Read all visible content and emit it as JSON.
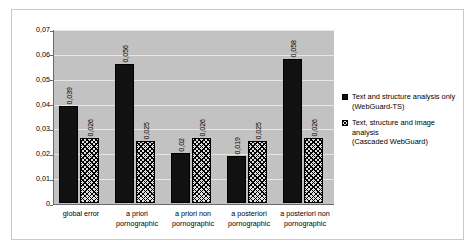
{
  "chart_data": {
    "type": "bar",
    "title": "",
    "xlabel": "",
    "ylabel": "",
    "ylim": [
      0,
      0.07
    ],
    "grid": true,
    "legend_position": "right",
    "decimal_separator": ",",
    "categories": [
      "global error",
      "a priori pornographic",
      "a priori non pornographic",
      "a posteriori pornographic",
      "a posteriori non pornographic"
    ],
    "category_lines": [
      [
        "global error"
      ],
      [
        "a priori",
        "pornographic"
      ],
      [
        "a priori non",
        "pornographic"
      ],
      [
        "a posteriori",
        "pornographic"
      ],
      [
        "a posteriori non",
        "pornographic"
      ]
    ],
    "ytick_labels": [
      "0",
      "0,01",
      "0,02",
      "0,03",
      "0,04",
      "0,05",
      "0,06",
      "0,07"
    ],
    "ytick_values": [
      0,
      0.01,
      0.02,
      0.03,
      0.04,
      0.05,
      0.06,
      0.07
    ],
    "series": [
      {
        "name": "Text and structure analysis only (WebGuard-TS)",
        "name_lines": [
          "Text and structure analysis only",
          "(WebGuard-TS)"
        ],
        "fill": "solid-black",
        "color": "#111111",
        "values": [
          0.039,
          0.056,
          0.02,
          0.019,
          0.058
        ],
        "labels": [
          "0,039",
          "0,056",
          "0,02",
          "0,019",
          "0,058"
        ]
      },
      {
        "name": "Text, structure and image analysis (Cascaded WebGuard)",
        "name_lines": [
          "Text, structure and image analysis",
          "(Cascaded WebGuard)"
        ],
        "fill": "diagonal-crosshatch",
        "color": "#dedede",
        "values": [
          0.026,
          0.025,
          0.026,
          0.025,
          0.026
        ],
        "labels": [
          "0,026",
          "0,025",
          "0,026",
          "0,025",
          "0,026"
        ]
      }
    ]
  },
  "plot": {
    "background_color": "#c2c2c2",
    "gridline_color": "#e6e6e6",
    "axis_color": "#6a6a6a"
  }
}
